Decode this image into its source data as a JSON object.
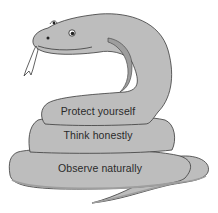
{
  "diagram": {
    "type": "coiled-snake-illustration",
    "colors": {
      "body_fill": "#bdbdbd",
      "body_shadow": "#9e9e9e",
      "outline": "#3a3a3a",
      "text": "#2a2a2a",
      "background": "#ffffff"
    },
    "coils": [
      {
        "position": "top",
        "label": "Protect yourself"
      },
      {
        "position": "middle",
        "label": "Think honestly"
      },
      {
        "position": "bottom",
        "label": "Observe naturally"
      }
    ]
  }
}
